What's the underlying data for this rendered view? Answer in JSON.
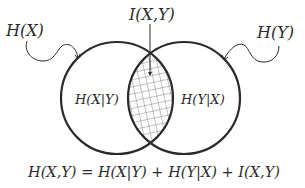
{
  "diagram": {
    "type": "venn",
    "labels": {
      "set_x": "H(X)",
      "set_y": "H(Y)",
      "intersection": "I(X,Y)",
      "left_only": "H(X|Y)",
      "right_only": "H(Y|X)"
    },
    "equation": "H(X,Y) = H(X|Y) + H(Y|X) + I(X,Y)",
    "colors": {
      "stroke": "#2b2b2b",
      "hatch": "#6a6a6a",
      "background": "#ffffff"
    }
  }
}
